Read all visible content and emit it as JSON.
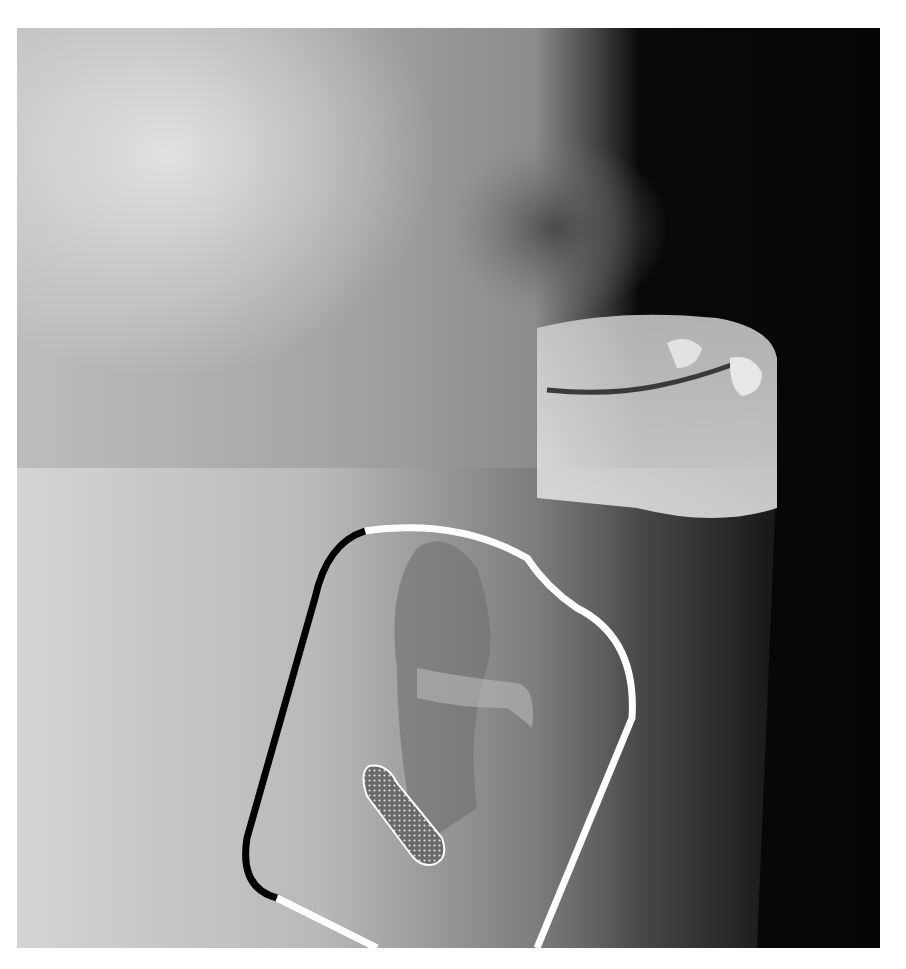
{
  "image": {
    "kind": "lateral radiograph of head and neck (videofluoroscopy still)",
    "frame": {
      "x": 17,
      "y": 28,
      "width": 863,
      "height": 920
    },
    "background_color": "#ffffff"
  },
  "annotations": {
    "outline": {
      "description": "pharyngeal region outline",
      "segments": [
        {
          "name": "posterior-wall",
          "color": "#000000"
        },
        {
          "name": "anterior-wall",
          "color": "#ffffff"
        },
        {
          "name": "inferior-edge",
          "color": "#ffffff"
        }
      ]
    },
    "residue_marker": {
      "description": "stippled elongated region (bolus residue)",
      "fill_pattern": "dot-grid",
      "stroke_color": "#ffffff"
    }
  },
  "colors": {
    "soft_tissue_light": "#d8d8d8",
    "mid_gray": "#8c8c8c",
    "air_dark": "#0a0a0a",
    "outline_white": "#ffffff",
    "outline_black": "#000000"
  }
}
